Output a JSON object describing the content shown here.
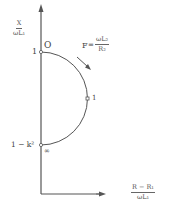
{
  "diagram": {
    "type": "circle-locus",
    "y_axis": {
      "label_num": "X",
      "label_den": "ωL₁"
    },
    "x_axis": {
      "label_num": "R − R₁",
      "label_den": "ωL₁"
    },
    "points": {
      "top_value": "1",
      "top_marker": "O",
      "bottom_value": "1 − k²",
      "bottom_marker": "∞",
      "mid_marker": "1"
    },
    "parameter": {
      "name": "F",
      "eq": "=",
      "num": "ωL₂",
      "den": "R₂"
    },
    "colors": {
      "line": "#555555",
      "text": "#444444"
    }
  }
}
